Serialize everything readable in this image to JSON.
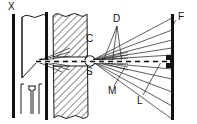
{
  "figure": {
    "kind": "optics-ray-diagram",
    "background_color": "#ffffff",
    "ink_color": "#111111",
    "width": 197,
    "height": 124
  },
  "labels": {
    "x_source": {
      "text": "X",
      "x": 8,
      "y": 3
    },
    "c_crystal": {
      "text": "C",
      "x": 86,
      "y": 36
    },
    "s_source": {
      "text": "S",
      "x": 86,
      "y": 68
    },
    "d_detector": {
      "text": "D",
      "x": 113,
      "y": 16
    },
    "m_marker": {
      "text": "M",
      "x": 109,
      "y": 89
    },
    "l_ray": {
      "text": "L",
      "x": 138,
      "y": 99
    },
    "f_film": {
      "text": "F",
      "x": 179,
      "y": 14
    }
  },
  "components": {
    "left_plate": {
      "name": "x-ray-tube-wall",
      "x": 13,
      "top": 14,
      "bottom": 118,
      "thickness": 3
    },
    "mid_plate": {
      "name": "collimator-wall",
      "x": 46,
      "top": 12,
      "bottom": 120,
      "thickness": 3
    },
    "film_plate": {
      "name": "film-plate-F",
      "x": 172,
      "top": 14,
      "bottom": 120,
      "thickness": 3
    },
    "detector_block": {
      "name": "detector-spot",
      "x": 168,
      "y": 56,
      "width": 6,
      "height": 12
    },
    "sample_circle": {
      "name": "sample-circle",
      "cx": 90,
      "cy": 61,
      "r": 5
    },
    "hatched_block": {
      "name": "shielding-block",
      "x": 53,
      "y": 14,
      "width": 35,
      "height": 104
    },
    "cone": {
      "name": "collimating-cone",
      "apex_x": 38,
      "apex_y": 61,
      "mouth_x": 22,
      "mouth_top": 16,
      "mouth_bottom": 78
    },
    "filament": {
      "name": "filament-fixture",
      "x": 22,
      "y": 84,
      "width": 20,
      "height": 30
    }
  },
  "axis": {
    "name": "optical-axis",
    "style": "dashed",
    "y": 61,
    "x_start": 36,
    "x_end": 170
  },
  "ray_fans": {
    "upper_fan": {
      "origin_x": 92,
      "origin_y": 61,
      "end_x": 172,
      "end_ys": [
        18,
        30,
        40,
        48,
        55
      ]
    },
    "lower_fan": {
      "origin_x": 92,
      "origin_y": 61,
      "end_x": 172,
      "end_ys": [
        70,
        80,
        92,
        105,
        118
      ]
    },
    "d_rays": {
      "apex_x": 116,
      "apex_y": 24,
      "feet": [
        [
          101,
          64
        ],
        [
          110,
          64
        ],
        [
          120,
          63
        ]
      ]
    },
    "leader_m": {
      "from_x": 113,
      "from_y": 86,
      "to_x": 124,
      "to_y": 68
    },
    "leader_l": {
      "from_x": 142,
      "from_y": 96,
      "to_x": 160,
      "to_y": 62
    }
  }
}
